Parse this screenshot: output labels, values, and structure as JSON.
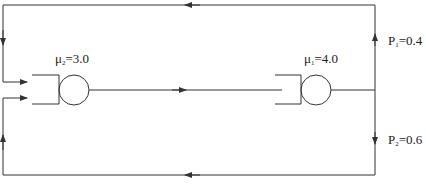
{
  "diagram": {
    "type": "queueing-network",
    "colors": {
      "line": "#333333",
      "background": "#ffffff"
    },
    "queues": [
      {
        "id": "queue-2",
        "mu_symbol": "μ",
        "mu_sub": "2",
        "mu_eq": "=3.0",
        "rate": 3.0
      },
      {
        "id": "queue-1",
        "mu_symbol": "μ",
        "mu_sub": "1",
        "mu_eq": "=4.0",
        "rate": 4.0
      }
    ],
    "branches": [
      {
        "id": "branch-1",
        "p_symbol": "P",
        "p_sub": "1",
        "p_eq": "=0.4",
        "probability": 0.4,
        "direction": "up"
      },
      {
        "id": "branch-2",
        "p_symbol": "P",
        "p_sub": "2",
        "p_eq": "=0.6",
        "probability": 0.6,
        "direction": "down"
      }
    ]
  }
}
